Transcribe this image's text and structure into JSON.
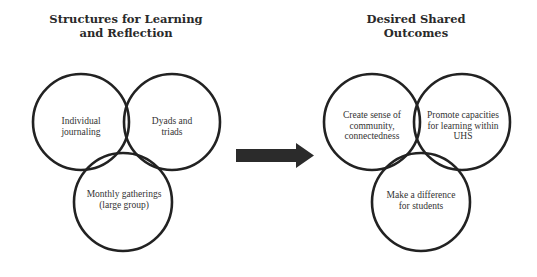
{
  "colors": {
    "stroke": "#222222",
    "arrow": "#2b2b2b",
    "text": "#333333",
    "background": "#ffffff"
  },
  "left_panel": {
    "title": "Structures for Learning\nand Reflection",
    "circles": [
      {
        "label": "Individual\njournaling"
      },
      {
        "label": "Dyads and\ntriads"
      },
      {
        "label": "Monthly gatherings\n(large group)"
      }
    ]
  },
  "arrow": {
    "icon": "right-arrow-icon"
  },
  "right_panel": {
    "title": "Desired Shared\nOutcomes",
    "circles": [
      {
        "label": "Create sense of\ncommunity,\nconnectedness"
      },
      {
        "label": "Promote capacities\nfor learning within\nUHS"
      },
      {
        "label": "Make a difference\nfor students"
      }
    ]
  }
}
